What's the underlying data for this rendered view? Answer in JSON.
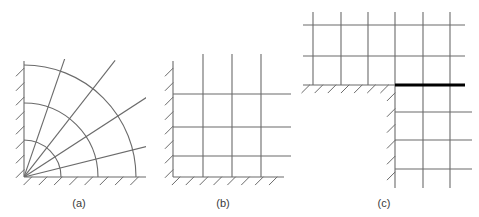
{
  "figure": {
    "kind": "technical-diagram",
    "background_color": "#ffffff",
    "grid_line_color": "#6b6b6b",
    "boundary_line_color": "#6b6b6b",
    "hatch_line_color": "#6b6b6b",
    "bold_line_color": "#000000",
    "caption_color": "#3a3a3a",
    "grid_line_width": 1.1,
    "bold_line_width": 3.2,
    "hatch_line_width": 1.0
  },
  "panels": [
    {
      "id": "a",
      "caption": "(a)",
      "mesh_type": "curvilinear",
      "caption_x": 79,
      "caption_y": 207,
      "origin": {
        "x": 24,
        "y": 177
      },
      "extent": {
        "width": 122,
        "height": 116
      },
      "left_boundary": {
        "x1": 24,
        "y1": 61,
        "x2": 24,
        "y2": 177
      },
      "bottom_boundary": {
        "x1": 24,
        "y1": 177,
        "x2": 146,
        "y2": 177
      },
      "radial_angles_deg": [
        14,
        33,
        52,
        71
      ],
      "radial_length": 148,
      "arc_radii": [
        37,
        74,
        112
      ],
      "hatch": {
        "left": {
          "count": 8,
          "length": 11,
          "angle_deg": 45,
          "spacing": 14.5
        },
        "bottom": {
          "count": 8,
          "length": 11,
          "angle_deg": 45,
          "spacing": 14.5
        }
      }
    },
    {
      "id": "b",
      "caption": "(b)",
      "mesh_type": "rectangular-cartesian",
      "caption_x": 223,
      "caption_y": 207,
      "origin": {
        "x": 173,
        "y": 177
      },
      "extent": {
        "width": 111,
        "height": 116
      },
      "left_boundary": {
        "x1": 173,
        "y1": 61,
        "x2": 173,
        "y2": 177
      },
      "bottom_boundary": {
        "x1": 173,
        "y1": 177,
        "x2": 284,
        "y2": 177
      },
      "vertical_lines_x": [
        203,
        232,
        261
      ],
      "horizontal_lines_y": [
        94,
        127,
        156
      ],
      "vertical_overshoot_top": 7,
      "horizontal_overshoot_right": 7,
      "hatch": {
        "left": {
          "count": 8,
          "length": 11,
          "angle_deg": 45,
          "spacing": 14.5
        },
        "bottom": {
          "count": 8,
          "length": 11,
          "angle_deg": 45,
          "spacing": 14.5
        }
      }
    },
    {
      "id": "c",
      "caption": "(c)",
      "mesh_type": "l-shaped-with-interface",
      "caption_x": 384,
      "caption_y": 207,
      "corner": {
        "x": 395,
        "y": 85
      },
      "upper_block": {
        "x_left": 303,
        "x_right": 465,
        "y_top": 25,
        "y_bottom": 85,
        "vertical_lines_x": [
          313,
          341,
          368,
          395,
          423,
          450
        ],
        "horizontal_lines_y": [
          25,
          56
        ],
        "vertical_overshoot_top": 13
      },
      "lower_block": {
        "x_left": 395,
        "x_right": 465,
        "y_top": 85,
        "y_bottom": 180,
        "vertical_lines_x": [
          423,
          450
        ],
        "horizontal_lines_y": [
          112,
          140,
          169
        ],
        "vertical_overshoot_bottom": 8,
        "horizontal_overshoot_right": 7
      },
      "bold_interface_line": {
        "x1": 395,
        "y1": 85,
        "x2": 465,
        "y2": 85
      },
      "support_edge_horizontal": {
        "x1": 303,
        "y1": 85,
        "x2": 395,
        "y2": 85
      },
      "support_edge_vertical": {
        "x1": 395,
        "y1": 85,
        "x2": 395,
        "y2": 180
      },
      "hatch": {
        "horizontal_edge": {
          "count": 7,
          "length": 11,
          "angle_deg": 45,
          "spacing": 13.5
        },
        "vertical_edge": {
          "count": 6,
          "length": 11,
          "angle_deg": 45,
          "spacing": 14.5
        }
      }
    }
  ]
}
